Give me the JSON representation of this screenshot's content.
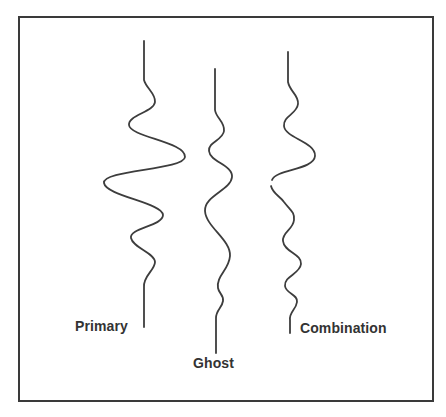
{
  "diagram": {
    "type": "seismic-wavelet-comparison",
    "traces": [
      {
        "id": "primary",
        "label": "Primary"
      },
      {
        "id": "ghost",
        "label": "Ghost"
      },
      {
        "id": "combination",
        "label": "Combination"
      }
    ],
    "colors": {
      "stroke": "#3d3d3d",
      "frame": "#3a3a3a",
      "background": "#ffffff",
      "text": "#333333"
    }
  }
}
